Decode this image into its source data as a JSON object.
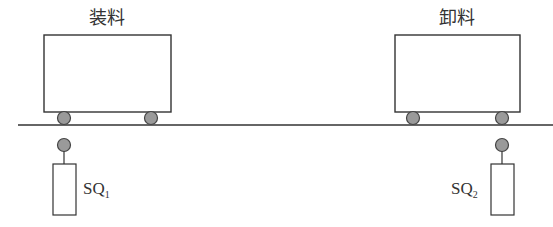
{
  "diagram": {
    "type": "rail-cart-limit-switch",
    "colors": {
      "line": "#333333",
      "wheel_fill": "#9a9a9a",
      "background": "#ffffff"
    },
    "stations": [
      {
        "title": "装料",
        "sensor_label": "SQ",
        "sensor_subscript": "1"
      },
      {
        "title": "卸料",
        "sensor_label": "SQ",
        "sensor_subscript": "2"
      }
    ]
  }
}
